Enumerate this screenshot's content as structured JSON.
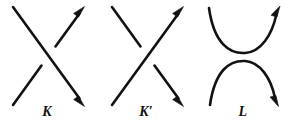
{
  "figure": {
    "name": "knot-crossing-skein-triple",
    "background_color": "#ffffff",
    "stroke_color": "#121212",
    "width": 291,
    "height": 125,
    "diagrams": [
      {
        "id": "K",
        "label": "K",
        "label_x": 47,
        "type": "positive-crossing",
        "description": "Two oriented strands crossing; the strand running from upper-left to lower-right passes over, the strand running from lower-left to upper-right is broken at the crossing.",
        "strands": [
          {
            "name": "over-strand",
            "from": [
              13,
              7
            ],
            "to": [
              84,
              105
            ],
            "arrow": "end",
            "arrow_direction": "lower-right",
            "broken": false
          },
          {
            "name": "under-strand",
            "from": [
              13,
              105
            ],
            "to": [
              84,
              7
            ],
            "arrow": "end",
            "arrow_direction": "upper-right",
            "broken": true,
            "break_center": [
              48,
              56
            ]
          }
        ]
      },
      {
        "id": "Kp",
        "label": "K′",
        "label_x": 146,
        "type": "negative-crossing",
        "description": "Two oriented strands crossing; the strand running from lower-left to upper-right passes over, the strand running from upper-left to lower-right is broken at the crossing.",
        "strands": [
          {
            "name": "over-strand",
            "from": [
              112,
              105
            ],
            "to": [
              183,
              7
            ],
            "arrow": "end",
            "arrow_direction": "upper-right",
            "broken": false
          },
          {
            "name": "under-strand",
            "from": [
              112,
              7
            ],
            "to": [
              183,
              105
            ],
            "arrow": "end",
            "arrow_direction": "lower-right",
            "broken": true,
            "break_center": [
              147,
              56
            ]
          }
        ]
      },
      {
        "id": "L",
        "label": "L",
        "label_x": 243,
        "type": "oriented-smoothing",
        "description": "Crossing replaced by two disjoint oriented arcs: an upper U-shaped arc opening upward and a lower cap-shaped arc opening downward.",
        "strands": [
          {
            "name": "upper-arc",
            "from": [
              209,
              8
            ],
            "to": [
              280,
              7
            ],
            "apex": [
              245,
              51
            ],
            "arrow": "end",
            "arrow_direction": "upper-right",
            "broken": false
          },
          {
            "name": "lower-arc",
            "from": [
              210,
              105
            ],
            "to": [
              278,
              104
            ],
            "apex": [
              244,
              61
            ],
            "arrow": "end",
            "arrow_direction": "lower-right",
            "broken": false
          }
        ]
      }
    ]
  }
}
